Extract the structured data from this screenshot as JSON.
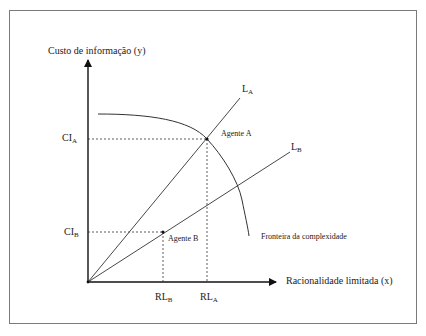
{
  "diagram": {
    "y_axis_label": "Custo de informação (y)",
    "x_axis_label": "Racionalidade limitada (x)",
    "y_ticks": [
      {
        "main": "CI",
        "sub": "A"
      },
      {
        "main": "CI",
        "sub": "B"
      }
    ],
    "x_ticks": [
      {
        "main": "RL",
        "sub": "B"
      },
      {
        "main": "RL",
        "sub": "A"
      }
    ],
    "lines": [
      {
        "main": "L",
        "sub": "A"
      },
      {
        "main": "L",
        "sub": "B"
      }
    ],
    "points": [
      {
        "label": "Agente A"
      },
      {
        "label": "Agente B"
      }
    ],
    "curve_label": "Fronteira da complexidade",
    "colors": {
      "line": "#2b2b2b",
      "frame": "#7a7a7a",
      "dashed": "#333333"
    }
  }
}
